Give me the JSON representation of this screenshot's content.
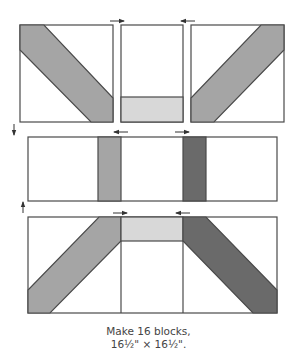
{
  "caption": {
    "line1": "Make 16 blocks,",
    "line2": "16½\" × 16½\"."
  },
  "colors": {
    "outline": "#4a4a4a",
    "background": "#ffffff",
    "light": "#d8d8d8",
    "medium": "#a5a5a5",
    "dark": "#6a6a6a",
    "arrow": "#333333"
  },
  "rows": [
    {
      "name": "top-row",
      "blocks": [
        {
          "name": "top-left-block",
          "desc": "diagonal medium stripe top-left to bottom-right"
        },
        {
          "name": "top-center-block",
          "desc": "white rectangle with light strip at bottom"
        },
        {
          "name": "top-right-block",
          "desc": "diagonal medium stripe top-right to bottom-left"
        }
      ],
      "press_arrows": [
        "right",
        "left"
      ]
    },
    {
      "name": "middle-row",
      "blocks": [
        {
          "name": "middle-strip",
          "desc": "white strip with medium and dark vertical bars"
        }
      ],
      "press_arrows": [
        "left",
        "right"
      ]
    },
    {
      "name": "bottom-row",
      "blocks": [
        {
          "name": "bottom-left-block",
          "desc": "diagonal medium stripe"
        },
        {
          "name": "bottom-center-block",
          "desc": "light strip at top"
        },
        {
          "name": "bottom-right-block",
          "desc": "diagonal dark stripe"
        }
      ],
      "press_arrows": [
        "right",
        "left"
      ]
    }
  ],
  "row_press_arrows": [
    "down",
    "up"
  ]
}
